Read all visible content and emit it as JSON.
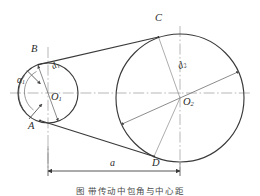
{
  "figure": {
    "title_caption": "图   带传动中包角与中心距",
    "points": {
      "B": "B",
      "C": "C",
      "A": "A",
      "D": "D",
      "O1": "O",
      "O1_sub": "1",
      "O2": "O",
      "O2_sub": "2"
    },
    "labels": {
      "alpha1": "α",
      "alpha1_sub": "1",
      "d1": "d",
      "d1_sub": "1",
      "d2": "d",
      "d2_sub": "2",
      "a": "a"
    },
    "colors": {
      "line": "#3a3a3a",
      "axis": "#8e8e8e",
      "thin": "#6f6f6f",
      "background": "#ffffff"
    },
    "geometry": {
      "small_pulley_center": [
        48,
        93
      ],
      "small_pulley_radius": 30,
      "large_pulley_center": [
        180,
        98
      ],
      "large_pulley_radius": 64,
      "center_distance_px": 132,
      "tangent_upper": [
        "B",
        "C"
      ],
      "tangent_lower": [
        "A",
        "D"
      ]
    }
  }
}
